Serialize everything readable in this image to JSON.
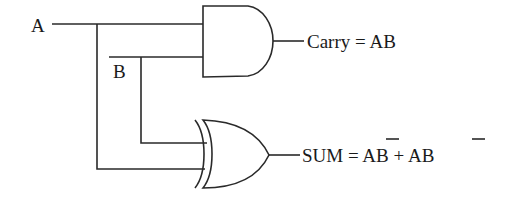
{
  "diagram": {
    "type": "half-adder logic circuit",
    "inputs": [
      {
        "label": "A"
      },
      {
        "label": "B"
      }
    ],
    "gates": [
      {
        "type": "AND",
        "output_label": "Carry = AB"
      },
      {
        "type": "XOR",
        "output_label_parts": {
          "prefix": "SUM = ",
          "term1_a": "A",
          "term1_b": "B",
          "plus": " + ",
          "term2_a": "A",
          "term2_b": "B"
        }
      }
    ],
    "colors": {
      "line": "#2a2a2a",
      "text": "#1a1a1a",
      "background": "#ffffff"
    }
  }
}
